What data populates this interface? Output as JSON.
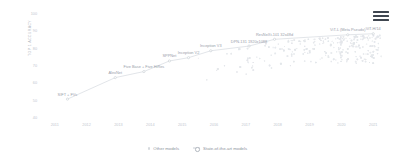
{
  "menu": {
    "name": "chart-menu",
    "label": "Menu"
  },
  "chart_data": {
    "type": "line",
    "title": "",
    "subtitle": "",
    "xlabel": "",
    "ylabel": "TOP 1 ACCURACY",
    "xlim": [
      2010.6,
      2021.4
    ],
    "ylim": [
      40,
      100
    ],
    "grid": false,
    "legend_position": "bottom",
    "x_ticks": [
      "2011",
      "2012",
      "2013",
      "2014",
      "2015",
      "2016",
      "2017",
      "2018",
      "2019",
      "2020",
      "2021"
    ],
    "x_tick_values": [
      2011,
      2012,
      2013,
      2014,
      2015,
      2016,
      2017,
      2018,
      2019,
      2020,
      2021
    ],
    "y_ticks": [
      "100",
      "90",
      "80",
      "70",
      "60",
      "50",
      "40"
    ],
    "y_tick_values": [
      100,
      90,
      80,
      70,
      60,
      50,
      40
    ],
    "legend": [
      {
        "name": "other-models",
        "label": "Other models",
        "marker": "dot",
        "color": "#d6dade"
      },
      {
        "name": "sota-models",
        "label": "State-of-the-art models",
        "marker": "line-circle",
        "color": "#c9ced4"
      }
    ],
    "series": [
      {
        "name": "State-of-the-art models",
        "color": "#c9ced4",
        "points": [
          {
            "label": "SIFT + FVs",
            "x": 2011.4,
            "y": 50.9
          },
          {
            "label": "AlexNet",
            "x": 2012.9,
            "y": 63.3
          },
          {
            "label": "Five Base + Five HiRes",
            "x": 2013.8,
            "y": 66.8
          },
          {
            "label": "SPPNet",
            "x": 2014.6,
            "y": 72.9
          },
          {
            "label": "Inception V2",
            "x": 2015.2,
            "y": 74.8
          },
          {
            "label": "Inception V3",
            "x": 2015.9,
            "y": 78.8
          },
          {
            "label": "DPN-131 1920x1088",
            "x": 2017.1,
            "y": 81.5
          },
          {
            "label": "ResNeXt-101 32x48d",
            "x": 2017.9,
            "y": 85.4
          },
          {
            "label": "ViT-L (Meta Pseudo)",
            "x": 2020.2,
            "y": 88.0
          },
          {
            "label": "ViT-H/14",
            "x": 2021.0,
            "y": 88.6
          }
        ]
      }
    ],
    "other_models": {
      "name": "Other models",
      "color": "#e3e6ea",
      "description": "Dense faint scatter cloud of non-SOTA model results, concentrated from 2016 to 2021 below the state-of-the-art frontier."
    }
  }
}
